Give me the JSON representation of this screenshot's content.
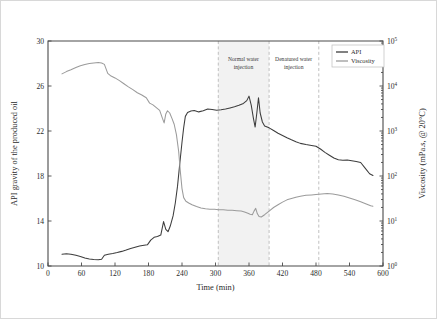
{
  "chart_data": {
    "type": "line",
    "title": "",
    "xlabel": "Time (min)",
    "ylabel": "API gravity of the produced oil",
    "y2label": "Viscosity (mPa.s, @ 20°C)",
    "xlim": [
      0,
      600
    ],
    "ylim": [
      10,
      30
    ],
    "y2lim_log10": [
      0,
      5
    ],
    "y2scale": "log",
    "grid": false,
    "xticks": [
      0,
      60,
      120,
      180,
      240,
      300,
      360,
      420,
      480,
      540,
      600
    ],
    "xticklabels": [
      "0",
      "60",
      "120",
      "180",
      "240",
      "300",
      "360",
      "420",
      "480",
      "540",
      "600"
    ],
    "yticks": [
      10,
      14,
      18,
      22,
      26,
      30
    ],
    "yticklabels": [
      "10",
      "14",
      "18",
      "22",
      "26",
      "30"
    ],
    "y2ticks_exponent": [
      0,
      1,
      2,
      3,
      4,
      5
    ],
    "y2ticklabels": [
      "10⁰",
      "10¹",
      "10²",
      "10³",
      "10⁴",
      "10⁵"
    ],
    "legend_position": "top-right",
    "legend": [
      {
        "name": "API",
        "color": "#3d3d3d"
      },
      {
        "name": "Viscosity",
        "color": "#9b9b9b"
      }
    ],
    "annotations": [
      {
        "text": "Normal water injection",
        "line1": "Normal water",
        "line2": "injection",
        "x_center": 350
      },
      {
        "text": "Denatured water injection",
        "line1": "Denatured water",
        "line2": "injection",
        "x_center": 440
      }
    ],
    "vlines": [
      305,
      396,
      485
    ],
    "shaded_bands": [
      {
        "x0": 305,
        "x1": 396,
        "color": "#f2f2f2"
      }
    ],
    "series": [
      {
        "name": "API",
        "axis": "left",
        "color": "#3d3d3d",
        "points": [
          [
            25,
            11.05
          ],
          [
            33,
            11.08
          ],
          [
            41,
            11.05
          ],
          [
            50,
            10.95
          ],
          [
            58,
            10.85
          ],
          [
            66,
            10.72
          ],
          [
            74,
            10.62
          ],
          [
            82,
            10.58
          ],
          [
            90,
            10.55
          ],
          [
            96,
            10.6
          ],
          [
            101,
            10.95
          ],
          [
            108,
            11.05
          ],
          [
            116,
            11.12
          ],
          [
            124,
            11.2
          ],
          [
            132,
            11.3
          ],
          [
            140,
            11.42
          ],
          [
            148,
            11.55
          ],
          [
            156,
            11.66
          ],
          [
            164,
            11.78
          ],
          [
            172,
            11.85
          ],
          [
            178,
            11.88
          ],
          [
            184,
            12.3
          ],
          [
            190,
            12.55
          ],
          [
            196,
            12.62
          ],
          [
            202,
            12.75
          ],
          [
            207,
            13.95
          ],
          [
            211,
            13.25
          ],
          [
            215,
            13.05
          ],
          [
            219,
            13.55
          ],
          [
            224,
            14.45
          ],
          [
            228,
            15.6
          ],
          [
            232,
            17.1
          ],
          [
            236,
            19.1
          ],
          [
            240,
            21.0
          ],
          [
            243,
            22.3
          ],
          [
            246,
            23.3
          ],
          [
            250,
            23.65
          ],
          [
            256,
            23.78
          ],
          [
            262,
            23.82
          ],
          [
            270,
            23.7
          ],
          [
            278,
            23.8
          ],
          [
            286,
            23.95
          ],
          [
            294,
            23.92
          ],
          [
            302,
            23.85
          ],
          [
            310,
            23.88
          ],
          [
            318,
            23.95
          ],
          [
            326,
            24.05
          ],
          [
            334,
            24.15
          ],
          [
            342,
            24.28
          ],
          [
            350,
            24.45
          ],
          [
            356,
            24.7
          ],
          [
            360,
            25.1
          ],
          [
            364,
            24.3
          ],
          [
            368,
            23.1
          ],
          [
            371,
            22.35
          ],
          [
            374,
            23.6
          ],
          [
            377,
            24.95
          ],
          [
            380,
            23.6
          ],
          [
            384,
            22.8
          ],
          [
            388,
            22.45
          ],
          [
            396,
            22.28
          ],
          [
            404,
            22.05
          ],
          [
            412,
            21.8
          ],
          [
            420,
            21.6
          ],
          [
            428,
            21.4
          ],
          [
            436,
            21.22
          ],
          [
            444,
            21.05
          ],
          [
            452,
            20.9
          ],
          [
            462,
            20.8
          ],
          [
            472,
            20.72
          ],
          [
            480,
            20.65
          ],
          [
            488,
            20.4
          ],
          [
            496,
            20.1
          ],
          [
            504,
            19.85
          ],
          [
            512,
            19.6
          ],
          [
            520,
            19.45
          ],
          [
            528,
            19.4
          ],
          [
            536,
            19.42
          ],
          [
            544,
            19.35
          ],
          [
            552,
            19.28
          ],
          [
            560,
            19.2
          ],
          [
            568,
            18.7
          ],
          [
            576,
            18.2
          ],
          [
            582,
            18.05
          ]
        ]
      },
      {
        "name": "Viscosity",
        "axis": "right",
        "color": "#9b9b9b",
        "points_log10": [
          [
            25,
            4.27
          ],
          [
            33,
            4.32
          ],
          [
            41,
            4.36
          ],
          [
            50,
            4.41
          ],
          [
            58,
            4.45
          ],
          [
            66,
            4.48
          ],
          [
            74,
            4.5
          ],
          [
            82,
            4.51
          ],
          [
            90,
            4.52
          ],
          [
            96,
            4.51
          ],
          [
            101,
            4.48
          ],
          [
            107,
            4.28
          ],
          [
            113,
            4.22
          ],
          [
            120,
            4.18
          ],
          [
            128,
            4.12
          ],
          [
            136,
            4.05
          ],
          [
            144,
            3.98
          ],
          [
            152,
            3.92
          ],
          [
            160,
            3.85
          ],
          [
            168,
            3.8
          ],
          [
            176,
            3.74
          ],
          [
            182,
            3.62
          ],
          [
            188,
            3.58
          ],
          [
            194,
            3.52
          ],
          [
            200,
            3.46
          ],
          [
            205,
            3.28
          ],
          [
            208,
            3.18
          ],
          [
            211,
            3.38
          ],
          [
            214,
            3.45
          ],
          [
            218,
            3.4
          ],
          [
            222,
            3.28
          ],
          [
            226,
            3.15
          ],
          [
            230,
            2.92
          ],
          [
            234,
            2.55
          ],
          [
            237,
            2.1
          ],
          [
            240,
            1.72
          ],
          [
            243,
            1.52
          ],
          [
            247,
            1.44
          ],
          [
            252,
            1.4
          ],
          [
            258,
            1.36
          ],
          [
            266,
            1.32
          ],
          [
            274,
            1.29
          ],
          [
            282,
            1.27
          ],
          [
            290,
            1.26
          ],
          [
            298,
            1.26
          ],
          [
            306,
            1.25
          ],
          [
            314,
            1.25
          ],
          [
            322,
            1.24
          ],
          [
            330,
            1.24
          ],
          [
            338,
            1.23
          ],
          [
            346,
            1.22
          ],
          [
            352,
            1.2
          ],
          [
            358,
            1.17
          ],
          [
            362,
            1.15
          ],
          [
            366,
            1.14
          ],
          [
            369,
            1.22
          ],
          [
            372,
            1.28
          ],
          [
            375,
            1.16
          ],
          [
            378,
            1.1
          ],
          [
            382,
            1.09
          ],
          [
            388,
            1.14
          ],
          [
            396,
            1.22
          ],
          [
            404,
            1.3
          ],
          [
            412,
            1.36
          ],
          [
            420,
            1.42
          ],
          [
            428,
            1.47
          ],
          [
            436,
            1.5
          ],
          [
            444,
            1.53
          ],
          [
            452,
            1.55
          ],
          [
            462,
            1.57
          ],
          [
            472,
            1.58
          ],
          [
            480,
            1.59
          ],
          [
            490,
            1.6
          ],
          [
            500,
            1.61
          ],
          [
            510,
            1.6
          ],
          [
            520,
            1.58
          ],
          [
            530,
            1.55
          ],
          [
            540,
            1.51
          ],
          [
            550,
            1.47
          ],
          [
            560,
            1.43
          ],
          [
            570,
            1.38
          ],
          [
            578,
            1.34
          ],
          [
            582,
            1.33
          ]
        ]
      }
    ]
  }
}
